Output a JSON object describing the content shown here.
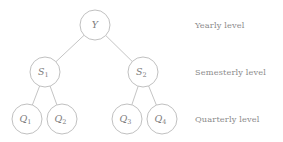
{
  "diagram": {
    "type": "hierarchical-tree",
    "title": "",
    "background_color": "#ffffff",
    "stroke_color": "#bdbdbd",
    "text_color": "#7d7d7d",
    "label_color": "#8a8a8a",
    "nodes": [
      {
        "id": "Y",
        "base": "Y",
        "sub": "",
        "cx": 95,
        "cy": 25,
        "r": 15,
        "level": 0
      },
      {
        "id": "S1",
        "base": "S",
        "sub": "1",
        "cx": 45,
        "cy": 72,
        "r": 15,
        "level": 1
      },
      {
        "id": "S2",
        "base": "S",
        "sub": "2",
        "cx": 143,
        "cy": 72,
        "r": 15,
        "level": 1
      },
      {
        "id": "Q1",
        "base": "Q",
        "sub": "1",
        "cx": 27,
        "cy": 119,
        "r": 15,
        "level": 2
      },
      {
        "id": "Q2",
        "base": "Q",
        "sub": "2",
        "cx": 62,
        "cy": 119,
        "r": 15,
        "level": 2
      },
      {
        "id": "Q3",
        "base": "Q",
        "sub": "3",
        "cx": 127,
        "cy": 119,
        "r": 15,
        "level": 2
      },
      {
        "id": "Q4",
        "base": "Q",
        "sub": "4",
        "cx": 162,
        "cy": 119,
        "r": 15,
        "level": 2
      }
    ],
    "edges": [
      {
        "from": "Y",
        "to": "S1"
      },
      {
        "from": "Y",
        "to": "S2"
      },
      {
        "from": "S1",
        "to": "Q1"
      },
      {
        "from": "S1",
        "to": "Q2"
      },
      {
        "from": "S2",
        "to": "Q3"
      },
      {
        "from": "S2",
        "to": "Q4"
      }
    ],
    "level_labels": [
      {
        "text": "Yearly level",
        "y": 25
      },
      {
        "text": "Semesterly level",
        "y": 72
      },
      {
        "text": "Quarterly level",
        "y": 119
      }
    ]
  }
}
